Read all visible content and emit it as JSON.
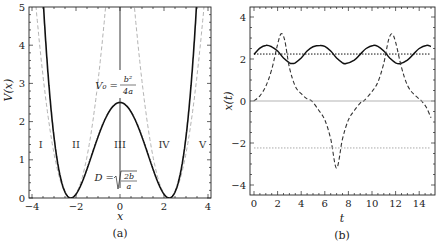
{
  "chart_data": [
    {
      "panel": "(a)",
      "type": "line",
      "xlabel": "x",
      "ylabel": "V(x)",
      "xlim": [
        -4.2,
        4.2
      ],
      "ylim": [
        0,
        5
      ],
      "xticks": [
        -4,
        -2,
        0,
        2,
        4
      ],
      "yticks": [
        0,
        1,
        2,
        3,
        4,
        5
      ],
      "grid": false,
      "params": {
        "V0": 2.5,
        "D": 2.236
      },
      "series": [
        {
          "name": "double-well potential V(x)=V0(1-x^2/D^2)^2",
          "style": "solid",
          "color": "#111111",
          "width": 1.6
        },
        {
          "name": "harmonic approximation left well",
          "style": "dashed",
          "color": "#aaaaaa",
          "center": -2.236,
          "k": 2.0
        },
        {
          "name": "harmonic approximation right well",
          "style": "dashed",
          "color": "#aaaaaa",
          "center": 2.236,
          "k": 2.0
        }
      ],
      "annotations": {
        "barrier_label": "V₀ = b²/4a",
        "barrier_num": "b²",
        "barrier_den": "4a",
        "barrier_lhs": "V₀ =",
        "distance_lhs": "D =",
        "distance_num": "2b",
        "distance_den": "a",
        "distance_label": "D = √(2b/a)",
        "regions": [
          "I",
          "II",
          "III",
          "IV",
          "V"
        ],
        "region_x": [
          -3.6,
          -2.0,
          0,
          2.0,
          3.75
        ],
        "region_y": 1.4
      },
      "caption": "(a)"
    },
    {
      "panel": "(b)",
      "type": "line",
      "xlabel": "t",
      "ylabel": "x(t)",
      "xlim": [
        -0.3,
        15
      ],
      "ylim": [
        -4.4,
        4.5
      ],
      "xticks": [
        0,
        2,
        4,
        6,
        8,
        10,
        12,
        14
      ],
      "yticks": [
        -4,
        -2,
        0,
        2,
        4
      ],
      "grid": false,
      "series": [
        {
          "name": "small oscillation in right well",
          "style": "solid",
          "color": "#111111",
          "t": [
            0,
            0.5,
            1,
            1.5,
            2,
            2.5,
            3,
            3.2,
            3.5,
            4,
            4.5,
            5,
            5.6,
            6,
            6.5,
            7,
            7.5,
            7.8,
            8.5,
            9,
            9.5,
            10.1,
            10.5,
            11,
            11.5,
            12,
            12.4,
            13,
            13.5,
            14,
            14.6,
            15
          ],
          "x": [
            2.22,
            2.52,
            2.65,
            2.58,
            2.38,
            2.05,
            1.82,
            1.78,
            1.82,
            2.05,
            2.38,
            2.58,
            2.65,
            2.6,
            2.38,
            2.05,
            1.82,
            1.78,
            1.95,
            2.22,
            2.5,
            2.65,
            2.6,
            2.38,
            2.05,
            1.82,
            1.78,
            1.95,
            2.22,
            2.5,
            2.65,
            2.6
          ]
        },
        {
          "name": "large oscillation crossing barrier",
          "style": "dashed",
          "color": "#333333",
          "t": [
            0,
            0.5,
            1,
            1.5,
            2,
            2.3,
            2.6,
            3,
            3.5,
            4,
            4.5,
            4.9,
            5.5,
            6,
            6.5,
            7,
            7.5,
            8,
            8.5,
            9,
            9.3,
            10,
            10.5,
            11,
            11.4,
            11.7,
            12,
            12.5,
            13,
            13.5,
            14,
            14.2,
            14.6,
            15
          ],
          "x": [
            0,
            0.25,
            0.7,
            1.5,
            2.7,
            3.2,
            2.9,
            1.6,
            0.7,
            0.35,
            0.1,
            0,
            -0.45,
            -0.9,
            -1.8,
            -3.2,
            -1.8,
            -0.9,
            -0.45,
            -0.1,
            0,
            0.45,
            0.9,
            1.8,
            2.9,
            3.2,
            2.8,
            1.6,
            0.75,
            0.35,
            0.1,
            0,
            -0.3,
            -0.8
          ]
        },
        {
          "name": "right well minimum",
          "style": "dotted",
          "color": "#111111",
          "y": 2.236
        },
        {
          "name": "left well minimum",
          "style": "dotted",
          "color": "#aaaaaa",
          "y": -2.236
        },
        {
          "name": "barrier top",
          "style": "solid",
          "color": "#aaaaaa",
          "y": 0
        }
      ],
      "caption": "(b)"
    }
  ]
}
